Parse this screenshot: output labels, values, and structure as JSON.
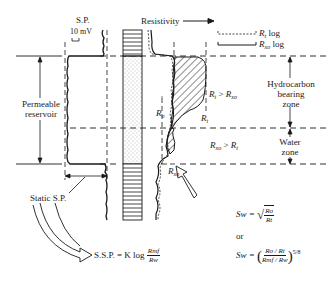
{
  "tracks": {
    "sp_label": "S.P.",
    "sp_scale": "10 mV",
    "resistivity_label": "Resistivity",
    "resistivity_arrow": "→"
  },
  "legend": {
    "rt_log": "Rt log",
    "rt_symbol": "R",
    "rt_sub": "t",
    "rt_suffix": "log",
    "rxo_symbol": "R",
    "rxo_sub": "xo",
    "rxo_suffix": "log"
  },
  "zones": {
    "permeable_reservoir": [
      "Permeable",
      "reservoir"
    ],
    "hydrocarbon_zone": [
      "Hydrocarbon",
      "bearing",
      "zone"
    ],
    "water_zone": [
      "Water",
      "zone"
    ],
    "hydrocarbon_condition": {
      "left": "R",
      "left_sub": "t",
      "op": ">",
      "right": "R",
      "right_sub": "xo"
    },
    "water_condition": {
      "left": "R",
      "left_sub": "xo",
      "op": ">",
      "right": "R",
      "right_sub": "t"
    }
  },
  "curve_labels": {
    "ro": {
      "sym": "R",
      "sub": "o"
    },
    "rt": {
      "sym": "R",
      "sub": "t"
    },
    "rxo": {
      "sym": "R",
      "sub": "xo"
    }
  },
  "annotations": {
    "static_sp": "Static S.P."
  },
  "equations": {
    "ssp": {
      "lhs": "S.S.P. = K log",
      "num": "Rmf",
      "den": "Rw"
    },
    "sw_sqrt": {
      "lhs": "Sw =",
      "num": "Ro",
      "den": "Rt"
    },
    "or": "or",
    "sw_ratio": {
      "lhs": "Sw =",
      "num": "Ro / Rt",
      "den": "Rmf / Rw",
      "exp": "5/8"
    }
  },
  "colors": {
    "ink": "#1a1a1a",
    "background": "#ffffff",
    "sand_dots": "#555555"
  }
}
